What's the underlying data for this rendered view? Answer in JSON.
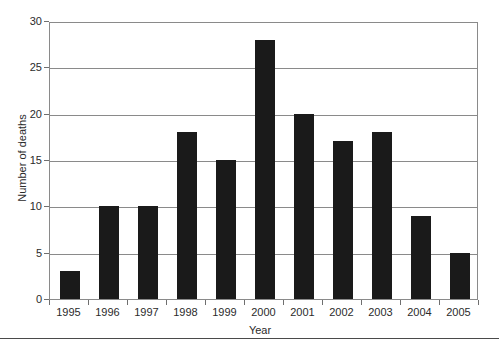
{
  "chart_data": {
    "type": "bar",
    "title": "",
    "xlabel": "Year",
    "ylabel": "Number of deaths",
    "categories": [
      "1995",
      "1996",
      "1997",
      "1998",
      "1999",
      "2000",
      "2001",
      "2002",
      "2003",
      "2004",
      "2005"
    ],
    "values": [
      3,
      10,
      10,
      18,
      15,
      28,
      20,
      17,
      18,
      9,
      5
    ],
    "ylim": [
      0,
      30
    ],
    "yticks": [
      0,
      5,
      10,
      15,
      20,
      25,
      30
    ],
    "ytick_labels": [
      "0",
      "5",
      "10",
      "15",
      "20",
      "25",
      "30"
    ],
    "grid": true,
    "grid_axis": "y",
    "legend": false,
    "legend_position": "none",
    "bar_color": "#1a1a1a",
    "grid_color": "#8a8a8a",
    "axis_color": "#8a8a8a",
    "background_color": "#ffffff"
  },
  "figure": {
    "xaxis_title": "Year",
    "yaxis_title": "Number of deaths"
  }
}
